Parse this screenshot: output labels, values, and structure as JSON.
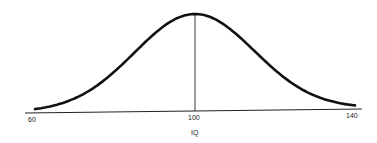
{
  "chart_data": {
    "type": "line",
    "title": "",
    "xlabel": "IQ",
    "ylabel": "",
    "x_ticks": [
      60,
      100,
      140
    ],
    "xlim": [
      60,
      140
    ],
    "grid": false,
    "legend": null,
    "distribution": {
      "kind": "normal",
      "mean": 100,
      "sd": 15
    },
    "annotations": [
      {
        "type": "vertical-line",
        "x": 100,
        "label": "mean"
      }
    ],
    "series": [
      {
        "name": "IQ distribution",
        "x": [
          60,
          65,
          70,
          75,
          80,
          85,
          90,
          95,
          100,
          105,
          110,
          115,
          120,
          125,
          130,
          135,
          140
        ],
        "values": [
          0.01,
          0.03,
          0.09,
          0.25,
          0.41,
          0.61,
          0.8,
          0.95,
          1.0,
          0.95,
          0.8,
          0.61,
          0.41,
          0.25,
          0.09,
          0.03,
          0.01
        ]
      }
    ]
  },
  "labels": {
    "tick_60": "60",
    "tick_100": "100",
    "tick_140": "140",
    "x_axis_title": "IQ"
  },
  "colors": {
    "curve": "#111111",
    "axis": "#222222"
  }
}
